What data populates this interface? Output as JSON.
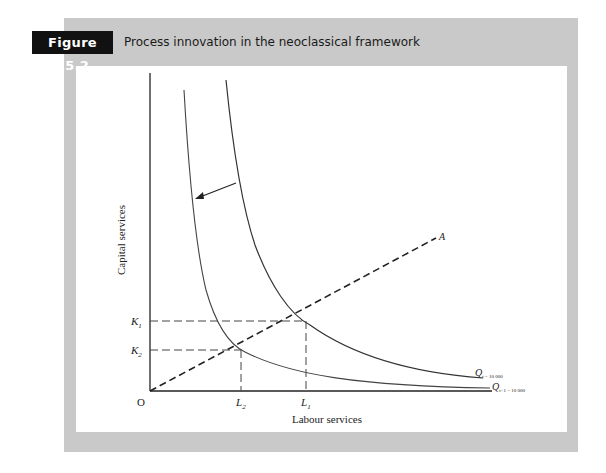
{
  "figure": {
    "label": "Figure 15.2",
    "title": "Process innovation in the neoclassical framework"
  },
  "axes": {
    "y_label": "Capital services",
    "x_label": "Labour services",
    "origin": "O"
  },
  "ticks": {
    "k1": "K",
    "k1_sub": "1",
    "k2": "K",
    "k2_sub": "2",
    "l1": "L",
    "l1_sub": "1",
    "l2": "L",
    "l2_sub": "2"
  },
  "ray": {
    "label": "A"
  },
  "curves": {
    "outer": {
      "name": "Q",
      "sub": "t = 10 000"
    },
    "inner": {
      "name": "Q",
      "sub": "t+1 = 10 000"
    }
  },
  "colors": {
    "panel": "#c9c9c9",
    "label_bg": "#111111",
    "ink": "#222222"
  }
}
